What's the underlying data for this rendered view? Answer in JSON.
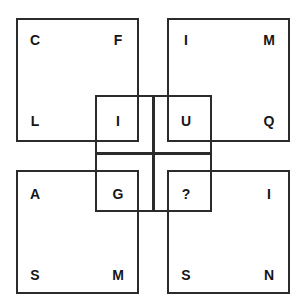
{
  "puzzle": {
    "type": "letter-grid-overlap-puzzle",
    "canvas": {
      "width": 306,
      "height": 308,
      "background": "#ffffff"
    },
    "stroke_color": "#2b2b2b",
    "text_color": "#161616",
    "missing_marker": "?",
    "big_squares": [
      {
        "id": "top-left",
        "letters": {
          "top_left": "C",
          "top_right": "F",
          "bottom_left": "L",
          "bottom_right": "I"
        }
      },
      {
        "id": "top-right",
        "letters": {
          "top_left": "I",
          "top_right": "M",
          "bottom_left": "U",
          "bottom_right": "Q"
        }
      },
      {
        "id": "bottom-left",
        "letters": {
          "top_left": "A",
          "top_right": "G",
          "bottom_left": "S",
          "bottom_right": "M"
        }
      },
      {
        "id": "bottom-right",
        "letters": {
          "top_left": "?",
          "top_right": "I",
          "bottom_left": "S",
          "bottom_right": "N"
        }
      }
    ],
    "small_squares": [
      {
        "id": "center-top-left",
        "letter": "I"
      },
      {
        "id": "center-top-right",
        "letter": "U"
      },
      {
        "id": "center-bottom-left",
        "letter": "G"
      },
      {
        "id": "center-bottom-right",
        "letter": "?"
      }
    ],
    "letters": {
      "tl_c": "C",
      "tl_f": "F",
      "tl_l": "L",
      "tl_i": "I",
      "tr_i": "I",
      "tr_m": "M",
      "tr_u": "U",
      "tr_q": "Q",
      "bl_a": "A",
      "bl_g": "G",
      "bl_s": "S",
      "bl_m": "M",
      "br_q": "?",
      "br_i": "I",
      "br_s": "S",
      "br_n": "N"
    }
  }
}
